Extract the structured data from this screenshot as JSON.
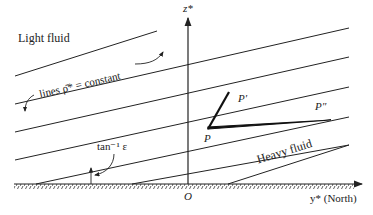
{
  "diagram": {
    "region_top_label": "Light fluid",
    "region_bottom_label": "Heavy fluid",
    "isopycnal_label": "lines ρ̄* = constant",
    "angle_label": "tan⁻¹ ε",
    "z_axis_label": "z*",
    "y_axis_label": "y* (North)",
    "origin_label": "O",
    "points": [
      {
        "name": "P",
        "label": "P"
      },
      {
        "name": "P-prime",
        "label": "P′"
      },
      {
        "name": "P-double-prime",
        "label": "P″"
      }
    ],
    "colors": {
      "line": "#222222",
      "background": "#ffffff"
    }
  }
}
